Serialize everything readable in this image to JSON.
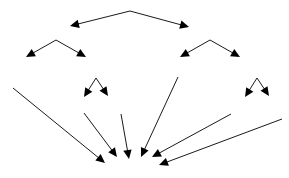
{
  "diagram": {
    "canvas": {
      "width": 289,
      "height": 178
    },
    "colors": {
      "stroke": "#000000",
      "background": "#ffffff"
    },
    "stroke_width": 0.9,
    "arrowhead": {
      "length": 9,
      "half_width": 4.2
    },
    "groups": [
      {
        "name": "top-level-double-arrow",
        "label": "Top double-headed arrow",
        "apex": {
          "x": 130,
          "y": 11
        },
        "arrows": [
          {
            "name": "top-arrow-left",
            "from": {
              "x": 130,
              "y": 11
            },
            "to": {
              "x": 70,
              "y": 26
            }
          },
          {
            "name": "top-arrow-right",
            "from": {
              "x": 130,
              "y": 11
            },
            "to": {
              "x": 189,
              "y": 27
            }
          }
        ]
      },
      {
        "name": "second-level-left-pair",
        "label": "Left branch arrow pair",
        "apex": {
          "x": 56,
          "y": 40
        },
        "arrows": [
          {
            "name": "left-branch-arrow-left",
            "from": {
              "x": 56,
              "y": 40
            },
            "to": {
              "x": 26,
              "y": 57
            }
          },
          {
            "name": "left-branch-arrow-right",
            "from": {
              "x": 56,
              "y": 40
            },
            "to": {
              "x": 86,
              "y": 57
            }
          }
        ]
      },
      {
        "name": "second-level-right-pair",
        "label": "Right branch arrow pair",
        "apex": {
          "x": 210,
          "y": 40
        },
        "arrows": [
          {
            "name": "right-branch-arrow-left",
            "from": {
              "x": 210,
              "y": 40
            },
            "to": {
              "x": 180,
              "y": 57
            }
          },
          {
            "name": "right-branch-arrow-right",
            "from": {
              "x": 210,
              "y": 40
            },
            "to": {
              "x": 240,
              "y": 57
            }
          }
        ]
      },
      {
        "name": "third-level-left-pair",
        "label": "Small left arrow pair",
        "apex": {
          "x": 96,
          "y": 78
        },
        "arrows": [
          {
            "name": "small-left-arrow-left",
            "from": {
              "x": 96,
              "y": 78
            },
            "to": {
              "x": 84,
              "y": 97
            }
          },
          {
            "name": "small-left-arrow-right",
            "from": {
              "x": 96,
              "y": 78
            },
            "to": {
              "x": 108,
              "y": 96
            }
          }
        ]
      },
      {
        "name": "third-level-right-pair",
        "label": "Small right arrow pair",
        "apex": {
          "x": 257,
          "y": 78
        },
        "arrows": [
          {
            "name": "small-right-arrow-left",
            "from": {
              "x": 257,
              "y": 78
            },
            "to": {
              "x": 245,
              "y": 97
            }
          },
          {
            "name": "small-right-arrow-right",
            "from": {
              "x": 257,
              "y": 78
            },
            "to": {
              "x": 269,
              "y": 96
            }
          }
        ]
      },
      {
        "name": "converging-arrows",
        "label": "Bottom converging arrows",
        "arrows": [
          {
            "name": "converge-arrow-1",
            "from": {
              "x": 13,
              "y": 88
            },
            "to": {
              "x": 105,
              "y": 163
            }
          },
          {
            "name": "converge-arrow-2",
            "from": {
              "x": 84,
              "y": 113
            },
            "to": {
              "x": 117,
              "y": 157
            }
          },
          {
            "name": "converge-arrow-3",
            "from": {
              "x": 121,
              "y": 114
            },
            "to": {
              "x": 129,
              "y": 159
            }
          },
          {
            "name": "converge-arrow-4",
            "from": {
              "x": 178,
              "y": 77
            },
            "to": {
              "x": 141,
              "y": 157
            }
          },
          {
            "name": "converge-arrow-5",
            "from": {
              "x": 231,
              "y": 114
            },
            "to": {
              "x": 152,
              "y": 157
            }
          },
          {
            "name": "converge-arrow-6",
            "from": {
              "x": 282,
              "y": 119
            },
            "to": {
              "x": 159,
              "y": 165
            }
          }
        ]
      }
    ]
  }
}
